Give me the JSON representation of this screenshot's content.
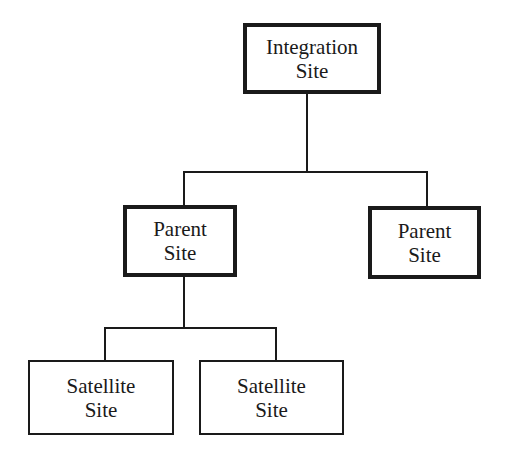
{
  "diagram": {
    "type": "hierarchy",
    "nodes": {
      "integration": {
        "line1": "Integration",
        "line2": "Site"
      },
      "parent_left": {
        "line1": "Parent",
        "line2": "Site"
      },
      "parent_right": {
        "line1": "Parent",
        "line2": "Site"
      },
      "satellite_left": {
        "line1": "Satellite",
        "line2": "Site"
      },
      "satellite_right": {
        "line1": "Satellite",
        "line2": "Site"
      }
    },
    "edges": [
      [
        "Integration Site",
        "Parent Site (left)"
      ],
      [
        "Integration Site",
        "Parent Site (right)"
      ],
      [
        "Parent Site (left)",
        "Satellite Site (left)"
      ],
      [
        "Parent Site (left)",
        "Satellite Site (right)"
      ]
    ],
    "colors": {
      "stroke": "#1a1a1a",
      "background": "#ffffff"
    }
  }
}
